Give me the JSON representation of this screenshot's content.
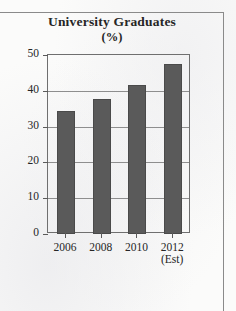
{
  "chart_data": {
    "type": "bar",
    "title": "University Graduates",
    "subtitle": "(%)",
    "xlabel": "",
    "ylabel": "",
    "categories": [
      "2006",
      "2008",
      "2010",
      "2012"
    ],
    "category_sublabels": [
      "",
      "",
      "",
      "(Est)"
    ],
    "values": [
      34.4,
      37.8,
      41.5,
      47.5
    ],
    "ylim": [
      0,
      50
    ],
    "yticks": [
      0,
      10,
      20,
      30,
      40,
      50
    ],
    "ytick_labels": [
      "0",
      "10",
      "20",
      "30",
      "40",
      "50"
    ],
    "grid": true,
    "legend": false,
    "bar_color": "#5a5a5a",
    "axis_color": "#6f6f6f",
    "grid_color": "#8e8e8e",
    "background_color": "#fbfbfa"
  }
}
